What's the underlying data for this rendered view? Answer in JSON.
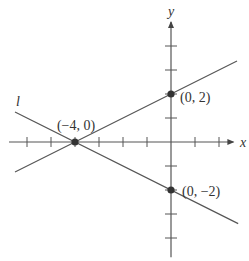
{
  "diagram": {
    "axes": {
      "x_label": "x",
      "y_label": "y",
      "x_ticks": [
        -6,
        -5,
        -4,
        -3,
        -2,
        -1,
        1,
        2
      ],
      "y_ticks": [
        4,
        3,
        2,
        1,
        -1,
        -2,
        -3,
        -4
      ],
      "x_range": [
        -6.75,
        2.6
      ],
      "y_range": [
        -4.8,
        5
      ]
    },
    "lines": [
      {
        "name": "line-through-neg4-0-and-0-2",
        "label": "",
        "slope": 0.5,
        "intercept": 2,
        "x_from": -6.5,
        "x_to": 2.75
      },
      {
        "name": "line-l",
        "label": "l",
        "slope": -0.5,
        "intercept": -2,
        "x_from": -6.5,
        "x_to": 2.8
      }
    ],
    "points": [
      {
        "name": "point-neg4-0",
        "x": -4,
        "y": 0,
        "label": "(−4, 0)"
      },
      {
        "name": "point-0-2",
        "x": 0,
        "y": 2,
        "label": "(0, 2)"
      },
      {
        "name": "point-0-neg2",
        "x": 0,
        "y": -2,
        "label": "(0, −2)"
      }
    ],
    "colors": {
      "stroke": "#555555",
      "point": "#333333",
      "text": "#333333"
    }
  }
}
